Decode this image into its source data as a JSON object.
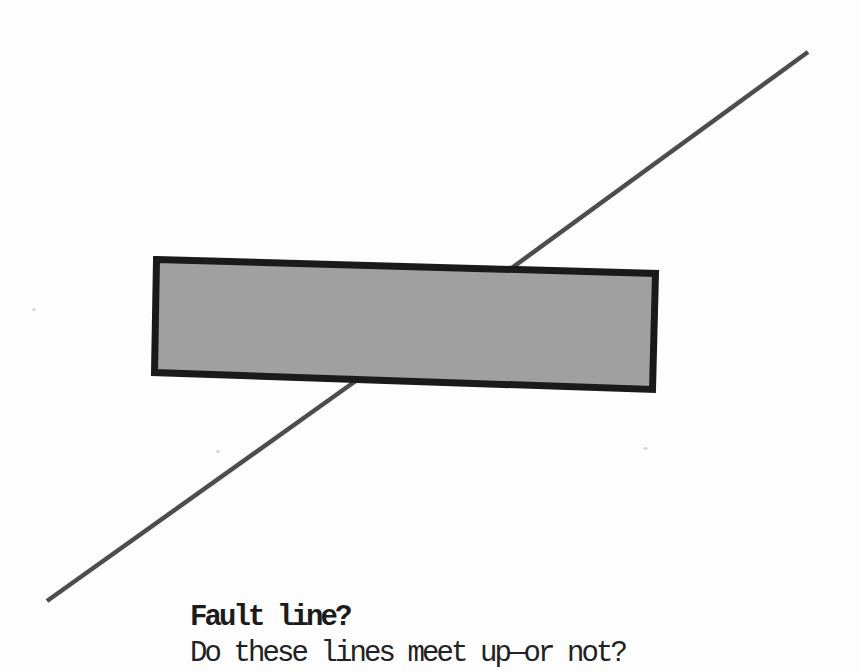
{
  "page": {
    "background": "#fdfdfd"
  },
  "figure": {
    "rectangle": {
      "fill": "#a0a0a0",
      "border_color": "#1a1a1a",
      "border_width": "7",
      "corners": "156.5,259.5 655.5,273.5 652.5,389.5 154.5,372.5"
    },
    "lines": {
      "color": "#4d4d4d",
      "width": "4.5",
      "upper": {
        "x1": "808",
        "y1": "52",
        "x2": "498",
        "y2": "278"
      },
      "lower": {
        "x1": "357",
        "y1": "380",
        "x2": "47",
        "y2": "601"
      }
    }
  },
  "caption": {
    "title": "Fault line?",
    "question": "Do these lines meet up—or not?",
    "color": "#1b1b1b"
  }
}
